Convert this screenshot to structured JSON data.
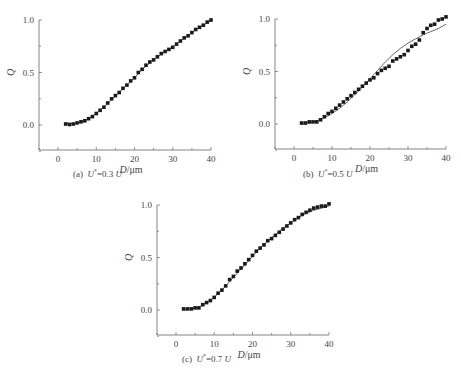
{
  "figure": {
    "panels": [
      {
        "id": "a",
        "caption_prefix": "(a)",
        "caption_var": "U",
        "caption_sup": "*",
        "caption_eq": "=0.3",
        "caption_unit": "U"
      },
      {
        "id": "b",
        "caption_prefix": "(b)",
        "caption_var": "U",
        "caption_sup": "*",
        "caption_eq": "=0.5",
        "caption_unit": "U"
      },
      {
        "id": "c",
        "caption_prefix": "(c)",
        "caption_var": "U",
        "caption_sup": "*",
        "caption_eq": "=0.7",
        "caption_unit": "U"
      }
    ]
  },
  "chart_data": [
    {
      "type": "scatter",
      "title": "(a) U*=0.3 U",
      "xlabel": "D/μm",
      "ylabel": "Q",
      "xlim": [
        -5,
        40
      ],
      "ylim": [
        -0.25,
        1.0
      ],
      "xticks": [
        0,
        10,
        20,
        30,
        40
      ],
      "yticks": [
        0.0,
        0.5,
        1.0
      ],
      "ytick_labels": [
        "0.0",
        "0.5",
        "1.0"
      ],
      "grid": false,
      "legend": null,
      "series": [
        {
          "name": "measured",
          "style": "square-markers",
          "x": [
            2,
            3,
            4,
            5,
            6,
            7,
            8,
            9,
            10,
            11,
            12,
            13,
            14,
            15,
            16,
            17,
            18,
            19,
            20,
            21,
            22,
            23,
            24,
            25,
            26,
            27,
            28,
            29,
            30,
            31,
            32,
            33,
            34,
            35,
            36,
            37,
            38,
            39,
            40
          ],
          "values": [
            0.01,
            0.005,
            0.01,
            0.02,
            0.03,
            0.04,
            0.06,
            0.08,
            0.11,
            0.14,
            0.17,
            0.21,
            0.25,
            0.28,
            0.31,
            0.35,
            0.38,
            0.42,
            0.45,
            0.5,
            0.53,
            0.57,
            0.6,
            0.62,
            0.65,
            0.68,
            0.7,
            0.72,
            0.74,
            0.77,
            0.8,
            0.83,
            0.85,
            0.88,
            0.91,
            0.93,
            0.95,
            0.98,
            1.0
          ]
        },
        {
          "name": "fit",
          "style": "line",
          "x": [
            2,
            4,
            6,
            8,
            10,
            12,
            14,
            16,
            18,
            20,
            22,
            24,
            26,
            28,
            30,
            32,
            34,
            36,
            38,
            40
          ],
          "values": [
            0.02,
            0.01,
            0.025,
            0.06,
            0.11,
            0.17,
            0.24,
            0.31,
            0.38,
            0.45,
            0.53,
            0.59,
            0.65,
            0.7,
            0.74,
            0.8,
            0.85,
            0.91,
            0.95,
            0.99
          ]
        }
      ]
    },
    {
      "type": "scatter",
      "title": "(b) U*=0.5 U",
      "xlabel": "D/μm",
      "ylabel": "Q",
      "xlim": [
        -5,
        40
      ],
      "ylim": [
        -0.25,
        1.0
      ],
      "xticks": [
        0,
        10,
        20,
        30,
        40
      ],
      "yticks": [
        0.0,
        0.5,
        1.0
      ],
      "ytick_labels": [
        "0.0",
        "0.5",
        "1.0"
      ],
      "grid": false,
      "legend": null,
      "series": [
        {
          "name": "measured",
          "style": "square-markers",
          "x": [
            2,
            3,
            4,
            5,
            6,
            7,
            8,
            9,
            10,
            11,
            12,
            13,
            14,
            15,
            16,
            17,
            18,
            19,
            20,
            21,
            22,
            23,
            24,
            25,
            26,
            27,
            28,
            29,
            30,
            31,
            32,
            33,
            34,
            35,
            36,
            37,
            38,
            39,
            40
          ],
          "values": [
            0.01,
            0.01,
            0.02,
            0.02,
            0.02,
            0.04,
            0.07,
            0.1,
            0.12,
            0.15,
            0.18,
            0.21,
            0.24,
            0.27,
            0.3,
            0.33,
            0.36,
            0.39,
            0.42,
            0.44,
            0.48,
            0.51,
            0.53,
            0.55,
            0.6,
            0.62,
            0.64,
            0.66,
            0.7,
            0.74,
            0.76,
            0.8,
            0.87,
            0.91,
            0.94,
            0.95,
            0.99,
            1.0,
            1.02
          ]
        },
        {
          "name": "fit",
          "style": "line",
          "x": [
            2,
            4,
            6,
            8,
            10,
            12,
            14,
            16,
            18,
            20,
            22,
            24,
            26,
            28,
            30,
            32,
            34,
            36,
            38,
            40
          ],
          "values": [
            0.0,
            0.01,
            0.03,
            0.06,
            0.1,
            0.15,
            0.21,
            0.28,
            0.35,
            0.43,
            0.51,
            0.59,
            0.66,
            0.72,
            0.77,
            0.81,
            0.85,
            0.88,
            0.91,
            0.95
          ]
        }
      ]
    },
    {
      "type": "scatter",
      "title": "(c) U*=0.7 U",
      "xlabel": "D/μm",
      "ylabel": "Q",
      "xlim": [
        -5,
        40
      ],
      "ylim": [
        -0.25,
        1.0
      ],
      "xticks": [
        0,
        10,
        20,
        30,
        40
      ],
      "yticks": [
        0.0,
        0.5,
        1.0
      ],
      "ytick_labels": [
        "0.0",
        "0.5",
        "1.0"
      ],
      "grid": false,
      "legend": null,
      "series": [
        {
          "name": "measured",
          "style": "square-markers",
          "x": [
            2,
            3,
            4,
            5,
            6,
            7,
            8,
            9,
            10,
            11,
            12,
            13,
            14,
            15,
            16,
            17,
            18,
            19,
            20,
            21,
            22,
            23,
            24,
            25,
            26,
            27,
            28,
            29,
            30,
            31,
            32,
            33,
            34,
            35,
            36,
            37,
            38,
            39,
            40
          ],
          "values": [
            0.01,
            0.01,
            0.01,
            0.02,
            0.02,
            0.05,
            0.07,
            0.09,
            0.12,
            0.16,
            0.19,
            0.23,
            0.29,
            0.32,
            0.37,
            0.4,
            0.44,
            0.48,
            0.52,
            0.56,
            0.59,
            0.62,
            0.66,
            0.68,
            0.71,
            0.74,
            0.77,
            0.8,
            0.83,
            0.86,
            0.88,
            0.91,
            0.93,
            0.95,
            0.97,
            0.98,
            0.99,
            0.99,
            1.01
          ]
        },
        {
          "name": "fit",
          "style": "line",
          "x": [
            2,
            4,
            6,
            8,
            10,
            12,
            14,
            16,
            18,
            20,
            22,
            24,
            26,
            28,
            30,
            32,
            34,
            36,
            38,
            40
          ],
          "values": [
            0.0,
            0.01,
            0.03,
            0.07,
            0.12,
            0.19,
            0.27,
            0.35,
            0.43,
            0.51,
            0.59,
            0.66,
            0.72,
            0.78,
            0.83,
            0.88,
            0.92,
            0.95,
            0.97,
            0.99
          ]
        }
      ]
    }
  ],
  "layout": {
    "panels": [
      {
        "x0px": 58,
        "x40px": 211,
        "y0px": 125,
        "y1px": 20,
        "axisLeft": 39,
        "axisBottom": 150,
        "captionX": 73,
        "captionY": 177,
        "xlabelY": 170
      },
      {
        "x0px": 294,
        "x40px": 446,
        "y0px": 124,
        "y1px": 19,
        "axisLeft": 275,
        "axisBottom": 149,
        "captionX": 303,
        "captionY": 177,
        "xlabelY": 169
      },
      {
        "x0px": 176,
        "x40px": 329,
        "y0px": 310,
        "y1px": 205,
        "axisLeft": 157,
        "axisBottom": 335,
        "captionX": 182,
        "captionY": 362,
        "xlabelY": 355
      }
    ]
  }
}
